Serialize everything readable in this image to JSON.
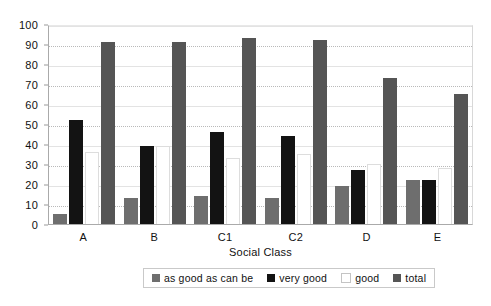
{
  "chart_data": {
    "type": "bar",
    "title": "",
    "xlabel": "Social Class",
    "ylabel": "",
    "ylim": [
      0,
      100
    ],
    "ytick_step": 10,
    "yticks": [
      100,
      90,
      80,
      70,
      60,
      50,
      40,
      30,
      20,
      10,
      0
    ],
    "grid": true,
    "legend_position": "bottom",
    "categories": [
      "A",
      "B",
      "C1",
      "C2",
      "D",
      "E"
    ],
    "series": [
      {
        "name": "as good as can be",
        "color": "#6e6e6e",
        "values": [
          5,
          13,
          14,
          13,
          19,
          22
        ]
      },
      {
        "name": "very good",
        "color": "#131313",
        "values": [
          52,
          39,
          46,
          44,
          27,
          22
        ]
      },
      {
        "name": "good",
        "color": "#ffffff",
        "values": [
          36,
          39,
          33,
          35,
          30,
          28
        ]
      },
      {
        "name": "total",
        "color": "#555555",
        "values": [
          91,
          91,
          93,
          92,
          73,
          65
        ]
      }
    ]
  },
  "legend": {
    "items": [
      {
        "label": "as good as can be"
      },
      {
        "label": "very good"
      },
      {
        "label": "good"
      },
      {
        "label": "total"
      }
    ]
  }
}
